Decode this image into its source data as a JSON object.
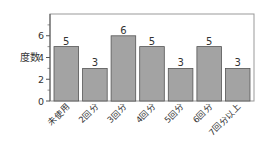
{
  "chart_data": {
    "type": "bar",
    "title": "",
    "xlabel": "",
    "ylabel": "度数",
    "categories": [
      "未使用",
      "2回分",
      "3回分",
      "4回分",
      "5回分",
      "6回分",
      "7回分以上"
    ],
    "values": [
      5,
      3,
      6,
      5,
      3,
      5,
      3
    ],
    "data_labels": [
      "5",
      "3",
      "6",
      "5",
      "3",
      "5",
      "3"
    ],
    "ylim": [
      0,
      8
    ],
    "yticks": [
      0,
      2,
      4,
      6
    ],
    "minor_yticks": [
      1,
      3,
      5,
      7
    ],
    "grid": false,
    "legend": null,
    "bar_color": "#a3a3a3",
    "bar_edge_color": "#555555",
    "frame_color": "#999999"
  }
}
